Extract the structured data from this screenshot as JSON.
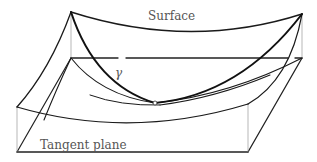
{
  "figure": {
    "labels": {
      "surface": "Surface",
      "tangent_plane": "Tangent plane",
      "curve": "γ"
    },
    "colors": {
      "stroke": "#1a1a1a",
      "thin_stroke": "#888888",
      "text": "#555555",
      "background": "#ffffff"
    }
  }
}
